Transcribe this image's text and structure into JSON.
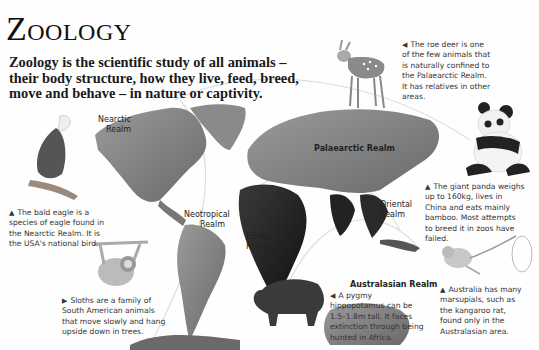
{
  "page": {
    "title": "Zoology",
    "intro": "Zoology is the scientific study of all animals – their body structure, how they live, feed, breed, move and behave – in nature or captivity."
  },
  "realms": [
    {
      "id": "nearctic",
      "label_line1": "Nearctic",
      "label_line2": "Realm"
    },
    {
      "id": "palaearctic",
      "label_line1": "Palaearctic Realm"
    },
    {
      "id": "neotropical",
      "label_line1": "Neotropical",
      "label_line2": "Realm"
    },
    {
      "id": "ethiopian",
      "label_line1": "Ethiopian",
      "label_line2": "Realm"
    },
    {
      "id": "oriental",
      "label_line1": "Oriental",
      "label_line2": "Realm"
    },
    {
      "id": "australasian",
      "label_line1": "Australasian Realm"
    }
  ],
  "captions": {
    "eagle": {
      "pointer": "▲",
      "text": "The bald eagle is a species of eagle found in the Nearctic Realm. It is the USA's national bird."
    },
    "sloth": {
      "pointer": "▶",
      "text": "Sloths are a family of South American animals that move slowly and hang upside down in trees."
    },
    "deer": {
      "pointer": "◀",
      "text": "The roe deer is one of the few animals that is naturally confined to the Palaearctic Realm. It has relatives in other areas."
    },
    "panda": {
      "pointer": "▲",
      "text": "The giant panda weighs up to 160kg, lives in China and eats mainly bamboo. Most attempts to breed it in zoos have failed."
    },
    "hippo": {
      "pointer": "◀",
      "text": "A pygmy hippopotamus can be 1.5–1.8m tall. It faces extinction through being hunted in Africa."
    },
    "kangaroo_rat": {
      "pointer": "▲",
      "text": "Australia has many marsupials, such as the kangaroo rat, found only in the Australasian area."
    }
  },
  "illustrations": [
    {
      "name": "bald-eagle",
      "kind": "animal"
    },
    {
      "name": "sloth",
      "kind": "animal"
    },
    {
      "name": "roe-deer",
      "kind": "animal"
    },
    {
      "name": "giant-panda",
      "kind": "animal"
    },
    {
      "name": "pygmy-hippopotamus",
      "kind": "animal"
    },
    {
      "name": "kangaroo-rat",
      "kind": "animal"
    },
    {
      "name": "world-map",
      "kind": "map"
    }
  ]
}
